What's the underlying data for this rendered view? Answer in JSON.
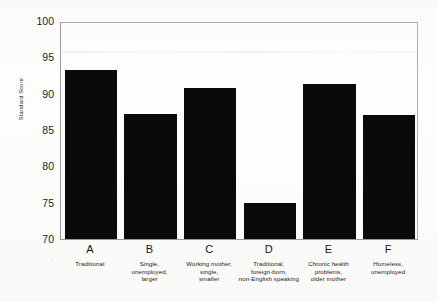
{
  "chart_data": {
    "type": "bar",
    "title": "",
    "xlabel": "",
    "ylabel": "Standard Score",
    "ylim": [
      70,
      100
    ],
    "yticks": [
      100,
      95,
      90,
      85,
      80,
      75,
      70
    ],
    "grid": false,
    "legend": "none",
    "bar_color": "#0a0a0a",
    "categories": [
      "A",
      "B",
      "C",
      "D",
      "E",
      "F"
    ],
    "category_descriptions": [
      "Traditional",
      "Single,\nunemployed,\nlarger",
      "Working mother,\nsingle,\nsmaller",
      "Traditional,\nforeign-born,\nnon-English speaking",
      "Chronic health\nproblems,\nolder mother",
      "Homeless,\nunemployed"
    ],
    "values": [
      93.5,
      87.3,
      91.0,
      75.0,
      91.5,
      87.2
    ],
    "bars": [
      {
        "letter": "A",
        "description": "Traditional",
        "value": 93.5
      },
      {
        "letter": "B",
        "description": "Single,\nunemployed,\nlarger",
        "value": 87.3
      },
      {
        "letter": "C",
        "description": "Working mother,\nsingle,\nsmaller",
        "value": 91.0
      },
      {
        "letter": "D",
        "description": "Traditional,\nforeign-born,\nnon-English speaking",
        "value": 75.0
      },
      {
        "letter": "E",
        "description": "Chronic health\nproblems,\nolder mother",
        "value": 91.5
      },
      {
        "letter": "F",
        "description": "Homeless,\nunemployed",
        "value": 87.2
      }
    ]
  }
}
